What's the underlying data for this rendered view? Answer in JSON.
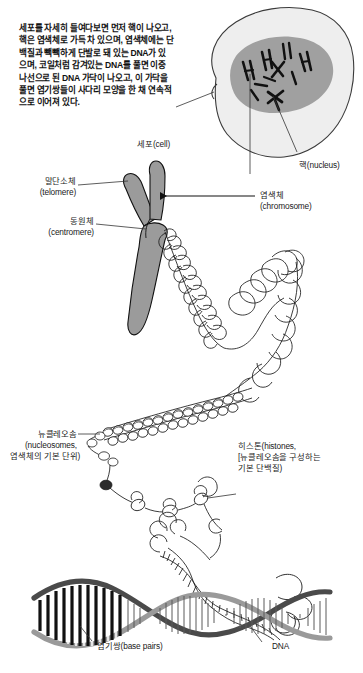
{
  "figure": {
    "type": "scientific-illustration",
    "language": "ko",
    "background_color": "#ffffff",
    "ink_color": "#1a1a1a",
    "chromosome_fill": "#9b9b9b",
    "nucleus_fill": "#a0a0a0",
    "cytoplasm_fill": "#eeeeee"
  },
  "intro": {
    "paragraph": "세포를 자세히 들여다보면 먼저 핵이 나오고,\n핵은 염색체로 가득 차 있으며, 염색체에는 단\n백질과 빽빽하게 단발로 돼 있는 DNA가 있\n으며, 코일처럼 감겨있는 DNA를 풀면 이중\n나선으로 된 DNA 가닥이 나오고, 이 가닥을\n풀면 염기쌍들이 사다리 모양을 한 채 연속적\n으로 이어져 있다."
  },
  "labels": {
    "cell": "세포(cell)",
    "nucleus": "핵(nucleus)",
    "telomere_ko": "말단소체",
    "telomere_en": "(telomere)",
    "centromere_ko": "동원체",
    "centromere_en": "(centromere)",
    "chromosome_ko": "염색체",
    "chromosome_en": "(chromosome)",
    "nucleosome_l1": "뉴클레오솜",
    "nucleosome_l2": "(nucleosomes,",
    "nucleosome_l3": "염색체의 기본 단위)",
    "histone_l1": "히스톤(histones,",
    "histone_l2": "[뉴클레오솜을 구성하는",
    "histone_l3": "기본 단백질)",
    "base_pairs": "염기쌍(base pairs)",
    "dna": "DNA"
  }
}
